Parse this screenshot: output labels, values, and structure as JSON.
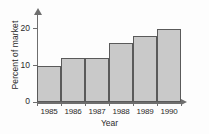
{
  "chart_data": {
    "type": "bar",
    "title": "",
    "xlabel": "Year",
    "ylabel": "Percent of market",
    "categories": [
      "1985",
      "1986",
      "1987",
      "1988",
      "1989",
      "1990"
    ],
    "values": [
      10,
      12,
      12,
      16,
      18,
      20
    ],
    "ylim": [
      0,
      24
    ],
    "yticks": [
      0,
      10,
      20
    ],
    "ytick_labels": [
      "0",
      "10",
      "20"
    ],
    "grid": false,
    "legend": null,
    "colors": {
      "bar_fill": "#c9c9c9",
      "bar_border": "#5a5a5a",
      "axis": "#6e6e6e",
      "text": "#2b2b2b",
      "background": "#fdfdfd"
    }
  }
}
